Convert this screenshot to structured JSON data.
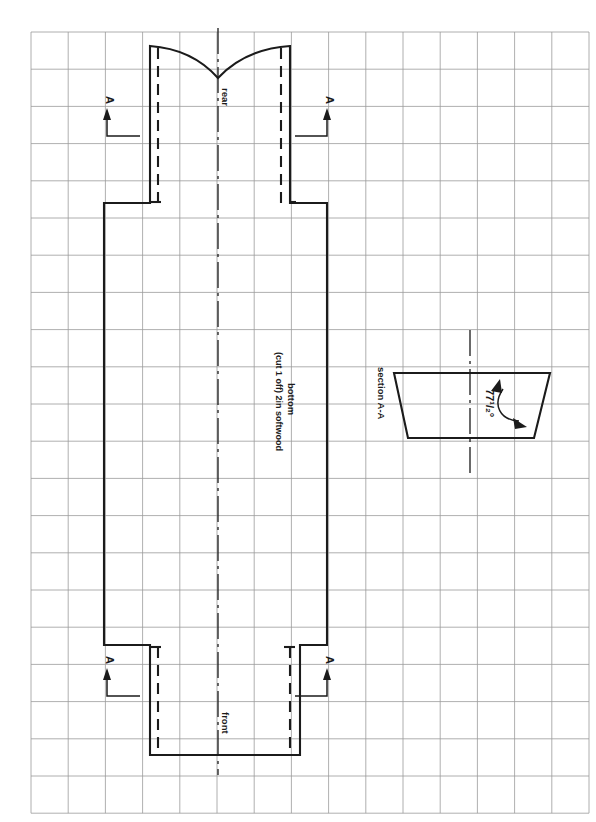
{
  "document": {
    "type": "technical-drawing",
    "background_color": "#ffffff",
    "line_color": "#1b1b1b",
    "grid_color": "#9a9a9a"
  },
  "grid": {
    "origin_x": 31,
    "origin_y": 32,
    "spacing": 37.2,
    "cols": 15,
    "rows": 21,
    "visible": true
  },
  "labels": {
    "rear": "rear",
    "front": "front",
    "part_name": "bottom",
    "part_note": "(cut 1 off) 2in softwood",
    "section_title": "section A-A",
    "angle": "77¹/₂°",
    "angle_plain": "77 1/2°",
    "section_mark_top_left": "A",
    "section_mark_top_right": "A",
    "section_mark_bottom_left": "A",
    "section_mark_bottom_right": "A"
  },
  "plan_view": {
    "name": "bottom-plan-view",
    "body_left_x": 104,
    "body_right_x": 327,
    "body_top_y": 203,
    "body_bottom_y": 645,
    "rear_neck_left_x": 150,
    "rear_neck_right_x": 290,
    "rear_top_y": 46,
    "rear_v_point_y": 78,
    "front_neck_left_x": 150,
    "front_neck_right_x": 300,
    "front_bottom_y": 755,
    "centerline_x": 218
  },
  "section_view": {
    "name": "section-a-a",
    "top_left_x": 394,
    "top_right_x": 550,
    "top_y": 373,
    "bottom_left_x": 408,
    "bottom_right_x": 534,
    "bottom_y": 438,
    "centerline_x": 470,
    "centerline_top_y": 330,
    "centerline_bottom_y": 478
  },
  "section_marks": [
    {
      "id": "top-left",
      "arrow_x": 107,
      "arrow_tip_y": 108,
      "leader_y": 136,
      "leader_to_x": 140,
      "label_y": 100
    },
    {
      "id": "top-right",
      "arrow_x": 327,
      "arrow_tip_y": 108,
      "leader_y": 136,
      "leader_to_x": 295,
      "label_y": 100
    },
    {
      "id": "bottom-left",
      "arrow_x": 107,
      "arrow_tip_y": 668,
      "leader_y": 696,
      "leader_to_x": 140,
      "label_y": 660
    },
    {
      "id": "bottom-right",
      "arrow_x": 327,
      "arrow_tip_y": 668,
      "leader_y": 696,
      "leader_to_x": 295,
      "label_y": 660
    }
  ]
}
